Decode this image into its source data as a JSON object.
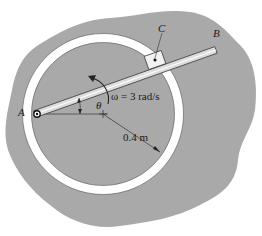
{
  "figure": {
    "labels": {
      "point_a": "A",
      "point_b": "B",
      "point_c": "C",
      "angle": "θ",
      "angular_velocity": "ω = 3 rad/s",
      "radius": "0.4 m"
    },
    "colors": {
      "background": "#ffffff",
      "region_fill": "#a9a9a9",
      "ring_fill": "#ffffff",
      "line": "#333333",
      "rod_fill": "#dcdcdc"
    }
  }
}
